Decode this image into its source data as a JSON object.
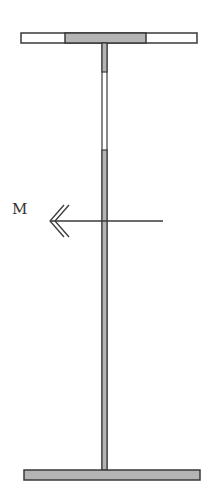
{
  "diagram": {
    "moment_label": "M",
    "colors": {
      "stroke": "#3a3a3a",
      "fill_gray": "#b4b4b4",
      "fill_white": "#ffffff"
    }
  }
}
